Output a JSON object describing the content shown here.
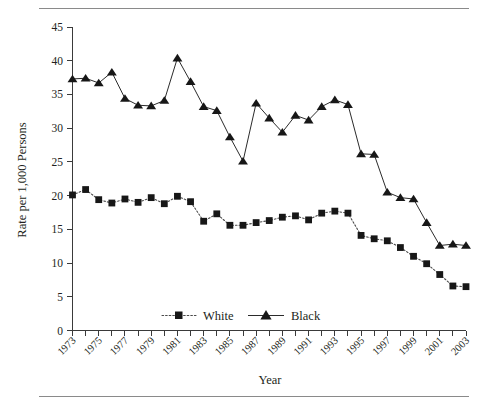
{
  "chart_data": {
    "type": "line",
    "title": "",
    "xlabel": "Year",
    "ylabel": "Rate per 1,000 Persons",
    "xlim": [
      1973,
      2003
    ],
    "ylim": [
      0,
      45
    ],
    "yticks": [
      0,
      5,
      10,
      15,
      20,
      25,
      30,
      35,
      40,
      45
    ],
    "ytick_labels": [
      "0",
      "5",
      "10",
      "15",
      "20",
      "25",
      "30",
      "35",
      "40",
      "45"
    ],
    "x": [
      1973,
      1974,
      1975,
      1976,
      1977,
      1978,
      1979,
      1980,
      1981,
      1982,
      1983,
      1984,
      1985,
      1986,
      1987,
      1988,
      1989,
      1990,
      1991,
      1992,
      1993,
      1994,
      1995,
      1996,
      1997,
      1998,
      1999,
      2000,
      2001,
      2002,
      2003
    ],
    "xtick_labels": [
      "1973",
      "1975",
      "1977",
      "1979",
      "1981",
      "1983",
      "1985",
      "1987",
      "1989",
      "1991",
      "1993",
      "1995",
      "1997",
      "1999",
      "2001",
      "2003"
    ],
    "xticks_labeled": [
      1973,
      1975,
      1977,
      1979,
      1981,
      1983,
      1985,
      1987,
      1989,
      1991,
      1993,
      1995,
      1997,
      1999,
      2001,
      2003
    ],
    "grid": false,
    "legend_position": "bottom-center",
    "series": [
      {
        "name": "White",
        "marker": "square",
        "linestyle": "dotted",
        "color": "#171717",
        "values": [
          20.1,
          20.9,
          19.4,
          18.9,
          19.5,
          19.0,
          19.7,
          18.8,
          19.9,
          19.1,
          16.2,
          17.3,
          15.6,
          15.6,
          16.0,
          16.3,
          16.8,
          17.0,
          16.4,
          17.4,
          17.7,
          17.4,
          14.1,
          13.6,
          13.3,
          12.3,
          11.0,
          9.9,
          8.3,
          6.6,
          6.5
        ]
      },
      {
        "name": "Black",
        "marker": "triangle",
        "linestyle": "solid",
        "color": "#171717",
        "values": [
          37.3,
          37.4,
          36.7,
          38.3,
          34.4,
          33.4,
          33.3,
          34.1,
          40.4,
          36.9,
          33.2,
          32.6,
          28.7,
          25.1,
          33.7,
          31.5,
          29.4,
          31.9,
          31.2,
          33.2,
          34.2,
          33.5,
          26.2,
          26.1,
          20.5,
          19.7,
          19.5,
          16.0,
          12.6,
          12.8,
          12.6
        ]
      }
    ]
  },
  "legend": {
    "items": [
      {
        "label": "White"
      },
      {
        "label": "Black"
      }
    ]
  }
}
